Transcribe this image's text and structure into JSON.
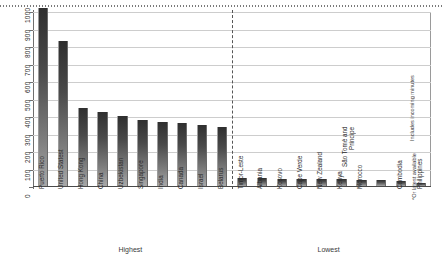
{
  "chart_data": {
    "type": "bar",
    "title": "",
    "subtitle": "",
    "xlabel": "",
    "ylabel": "",
    "ylim": [
      0,
      1000
    ],
    "ytick_labels": [
      "0",
      "100",
      "200",
      "300",
      "400",
      "500",
      "600",
      "700",
      "800",
      "900",
      "1000"
    ],
    "ytick_values": [
      0,
      100,
      200,
      300,
      400,
      500,
      600,
      700,
      800,
      900,
      1000
    ],
    "grid": true,
    "legend": "none",
    "categories": [
      "Puerto Rico",
      "United Statest",
      "Hong Kong",
      "China",
      "Uzbekistan",
      "Singapore",
      "India",
      "Canada",
      "Israel",
      "Belarus",
      "Timor-Leste",
      "Albania",
      "Kosovo",
      "Cape Verde",
      "New Zealand",
      "Kenya",
      "Morocco",
      "São Tomé and Príncipe",
      "Cambodia",
      "Philippines"
    ],
    "values": [
      1050,
      830,
      448,
      425,
      398,
      378,
      367,
      362,
      350,
      338,
      48,
      44,
      42,
      40,
      39,
      38,
      36,
      34,
      26,
      18
    ],
    "groups": [
      {
        "label": "Highest",
        "start_index": 0,
        "end_index": 9
      },
      {
        "label": "Lowest",
        "start_index": 10,
        "end_index": 19
      }
    ],
    "divider_after_index": 9,
    "annotations": [
      "Includes incoming minutes",
      "*Or latest available"
    ],
    "bar_color_top": "#2f2f2f",
    "bar_color_bottom": "#a8a8a8",
    "gridline_color": "#cdcdcd",
    "axis_color": "#4a4a4a"
  },
  "notes": {
    "includes_incoming": "Includes incoming minutes",
    "latest_available": "*Or latest available"
  }
}
